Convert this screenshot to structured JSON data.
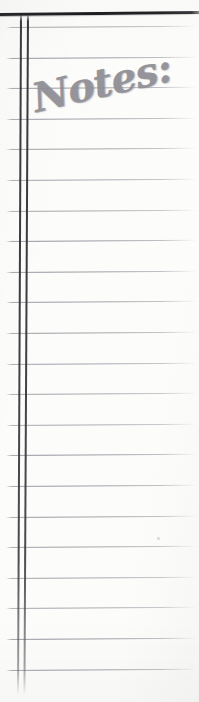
{
  "document": {
    "kind": "scanned-lined-notebook-page",
    "page_width": 199,
    "page_height": 702,
    "background_color": "#fcfcfb"
  },
  "heading": {
    "text": "Notes:",
    "style": "handwritten-italic-script",
    "color": "#8d8d93",
    "rotation_deg": -13,
    "left": 38,
    "top": 74,
    "font_size": 40
  },
  "top_rule": {
    "name": "top-heavy-rule",
    "color": "#1e1e20",
    "y": 13,
    "thickness": 2.6,
    "rotation_deg": -0.55
  },
  "margin": {
    "name": "double-vertical-margin",
    "color": "#2a2a2e",
    "line_x_positions": [
      20,
      27
    ],
    "y_start": 13,
    "y_end": 695,
    "thickness": 1.5
  },
  "ruling": {
    "name": "horizontal-ruled-lines",
    "color": "#8d8d96",
    "first_line_y": 27,
    "spacing": 30.6,
    "count": 22,
    "x_start": 6,
    "x_end": 196,
    "rotation_deg": -0.35,
    "line_y_positions": [
      27,
      57.6,
      88.2,
      118.8,
      149.4,
      180,
      210.6,
      241.2,
      271.8,
      302.4,
      333,
      363.6,
      394.2,
      424.8,
      455.4,
      486,
      516.6,
      547.2,
      577.8,
      608.4,
      639,
      669.6
    ]
  },
  "marks": {
    "scan_speck": {
      "name": "scan-speck",
      "x": 157,
      "y": 537
    }
  }
}
